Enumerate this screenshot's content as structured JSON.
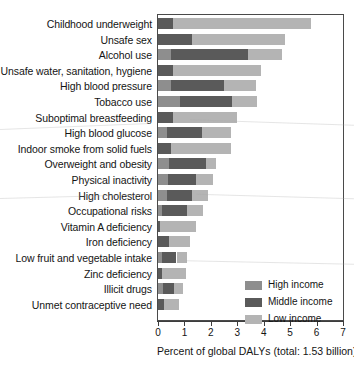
{
  "chart_data": {
    "type": "bar",
    "orientation": "horizontal",
    "stacked": true,
    "title": "",
    "xlabel": "Percent of global DALYs (total: 1.53 billion)",
    "ylabel": "",
    "xlim": [
      0,
      7
    ],
    "xticks": [
      0,
      1,
      2,
      3,
      4,
      5,
      6,
      7
    ],
    "xtick_labels": [
      "0",
      "1",
      "2",
      "3",
      "4",
      "5",
      "6",
      "7"
    ],
    "grid": false,
    "legend_position": "inside-lower-right",
    "legend_entries": [
      "High income",
      "Middle income",
      "Low income"
    ],
    "series": [
      {
        "name": "High income",
        "color": "#8e8e8e",
        "values": [
          0.0,
          0.0,
          0.5,
          0.0,
          0.5,
          0.85,
          0.0,
          0.35,
          0.0,
          0.4,
          0.37,
          0.35,
          0.15,
          0.0,
          0.0,
          0.15,
          0.0,
          0.2,
          0.0
        ]
      },
      {
        "name": "Middle income",
        "color": "#5a5a5a",
        "values": [
          0.55,
          1.3,
          2.9,
          0.55,
          2.0,
          1.95,
          0.55,
          1.3,
          0.5,
          1.4,
          1.05,
          0.95,
          0.95,
          0.08,
          0.4,
          0.55,
          0.15,
          0.4,
          0.22
        ]
      },
      {
        "name": "Low income",
        "color": "#b4b4b4",
        "values": [
          5.25,
          3.5,
          1.3,
          3.35,
          1.2,
          0.95,
          2.45,
          1.1,
          2.25,
          0.4,
          0.68,
          0.6,
          0.62,
          1.34,
          0.82,
          0.38,
          0.9,
          0.33,
          0.57
        ]
      }
    ],
    "categories": [
      "Childhood underweight",
      "Unsafe sex",
      "Alcohol use",
      "Unsafe water, sanitation, hygiene",
      "High blood pressure",
      "Tobacco use",
      "Suboptimal breastfeeding",
      "High blood glucose",
      "Indoor smoke from solid fuels",
      "Overweight and obesity",
      "Physical inactivity",
      "High cholesterol",
      "Occupational risks",
      "Vitamin A deficiency",
      "Iron deficiency",
      "Low fruit and vegetable intake",
      "Zinc deficiency",
      "Illicit drugs",
      "Unmet contraceptive need"
    ],
    "totals": [
      5.8,
      4.8,
      4.7,
      3.9,
      3.7,
      3.75,
      3.0,
      2.75,
      2.75,
      2.2,
      2.1,
      1.9,
      1.72,
      1.42,
      1.22,
      1.08,
      1.05,
      0.93,
      0.79
    ]
  },
  "axis": {
    "x_title": "Percent of global DALYs (total: 1.53 billion)"
  },
  "legend": {
    "items": [
      {
        "label": "High income",
        "color": "#8e8e8e"
      },
      {
        "label": "Middle income",
        "color": "#5a5a5a"
      },
      {
        "label": "Low income",
        "color": "#b4b4b4"
      }
    ]
  }
}
